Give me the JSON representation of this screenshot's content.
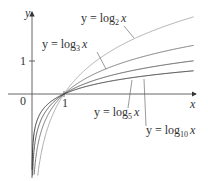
{
  "chart_data": {
    "type": "line",
    "title": "",
    "xlabel": "x",
    "ylabel": "y",
    "xlim": [
      -1,
      5
    ],
    "ylim": [
      -2.6,
      2.9
    ],
    "grid": false,
    "legend_position": "inline annotations",
    "ticks": {
      "x": [
        "0",
        "1"
      ],
      "y": [
        "1"
      ]
    },
    "series": [
      {
        "name": "y = log_2 x",
        "base": 2,
        "color": "#aaaaaa"
      },
      {
        "name": "y = log_3 x",
        "base": 3,
        "color": "#777777"
      },
      {
        "name": "y = log_5 x",
        "base": 5,
        "color": "#555555"
      },
      {
        "name": "y = log_10 x",
        "base": 10,
        "color": "#333333"
      }
    ]
  },
  "labels": {
    "y_axis": "y",
    "x_axis": "x",
    "origin": "0",
    "x_tick_1": "1",
    "y_tick_1": "1",
    "log2": {
      "prefix": "y = log",
      "base": "2",
      "suffix": "x"
    },
    "log3": {
      "prefix": "y = log",
      "base": "3",
      "suffix": "x"
    },
    "log5": {
      "prefix": "y = log",
      "base": "5",
      "suffix": "x"
    },
    "log10": {
      "prefix": "y = log",
      "base": "10",
      "suffix": "x"
    }
  }
}
